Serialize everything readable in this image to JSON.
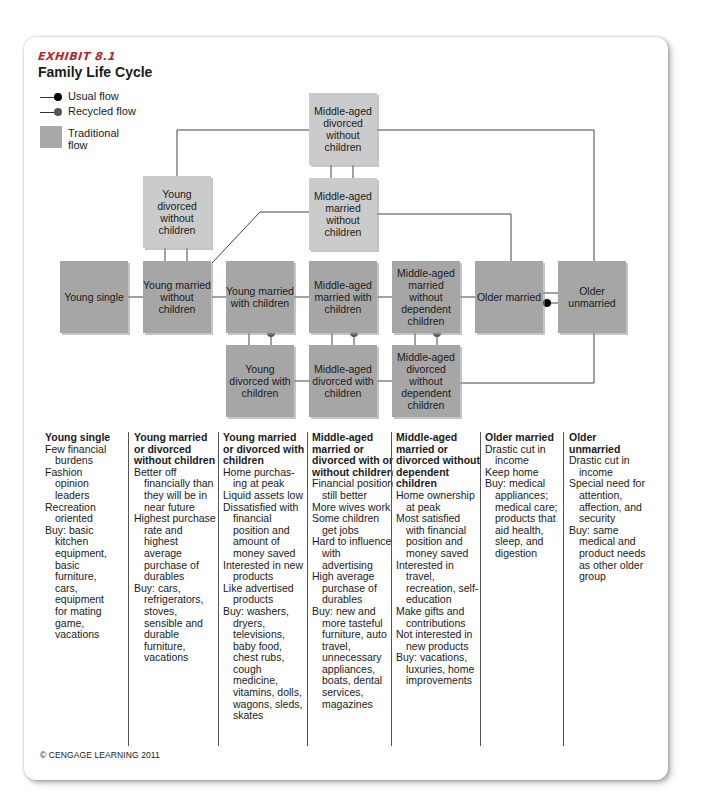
{
  "exhibit": {
    "label": "EXHIBIT 8.1",
    "title": "Family Life Cycle"
  },
  "legend": {
    "usual_flow": "Usual flow",
    "recycled_flow": "Recycled flow",
    "traditional_flow": "Traditional flow",
    "colors": {
      "usual_dot": "#000000",
      "recycled_dot": "#555555",
      "traditional_box": "#a6a6a6",
      "alternate_box": "#cbcbcb"
    }
  },
  "nodes": {
    "young_single": "Young single",
    "young_married_without_children": "Young married without children",
    "young_married_with_children": "Young married with children",
    "middle_aged_married_with_children": "Middle-aged married with children",
    "middle_aged_married_without_dependent_children": "Middle-aged married without dependent children",
    "older_married": "Older married",
    "older_unmarried": "Older unmarried",
    "young_divorced_without_children": "Young divorced without children",
    "middle_aged_divorced_without_children": "Middle-aged divorced without children",
    "middle_aged_married_without_children": "Middle-aged married without children",
    "young_divorced_with_children": "Young divorced with children",
    "middle_aged_divorced_with_children": "Middle-aged divorced with children",
    "middle_aged_divorced_without_dependent_children": "Middle-aged divorced without dependent children"
  },
  "columns": [
    {
      "heading": "Young single",
      "items": [
        "Few financial burdens",
        "Fashion opinion leaders",
        "Recreation oriented",
        "Buy: basic kitchen equipment, basic furniture, cars, equipment for mating game, vacations"
      ]
    },
    {
      "heading": "Young married or divorced without children",
      "items": [
        "Better off financially than they will be in near future",
        "Highest purchase rate and highest average purchase of durables",
        "Buy: cars, refrigerators, stoves, sensible and durable furniture, vacations"
      ]
    },
    {
      "heading": "Young married or divorced with children",
      "items": [
        "Home purchas-ing at peak",
        "Liquid assets low",
        "Dissatisfied with financial position and amount of money saved",
        "Interested in new products",
        "Like advertised products",
        "Buy: washers, dryers, televisions, baby food, chest rubs, cough medicine, vitamins, dolls, wagons, sleds, skates"
      ]
    },
    {
      "heading": "Middle-aged married or divorced with or without children",
      "items": [
        "Financial position still better",
        "More wives work",
        "Some children get jobs",
        "Hard to influence with advertising",
        "High average purchase of durables",
        "Buy: new and more tasteful furniture, auto travel, unnecessary appliances, boats, dental services, magazines"
      ]
    },
    {
      "heading": "Middle-aged married or divorced without dependent children",
      "items": [
        "Home ownership at peak",
        "Most satisfied with financial position and money saved",
        "Interested in travel, recreation, self-education",
        "Make gifts and contributions",
        "Not interested in new products",
        "Buy: vacations, luxuries, home improvements"
      ]
    },
    {
      "heading": "Older married",
      "items": [
        "Drastic cut in income",
        "Keep home",
        "Buy: medical appliances; medical care; products that aid health, sleep, and digestion"
      ]
    },
    {
      "heading": "Older unmarried",
      "items": [
        "Drastic cut in income",
        "Special need for attention, affection, and security",
        "Buy: same medical and product needs as other older group"
      ]
    }
  ],
  "footer": {
    "copyright": "© CENGAGE LEARNING 2011"
  }
}
